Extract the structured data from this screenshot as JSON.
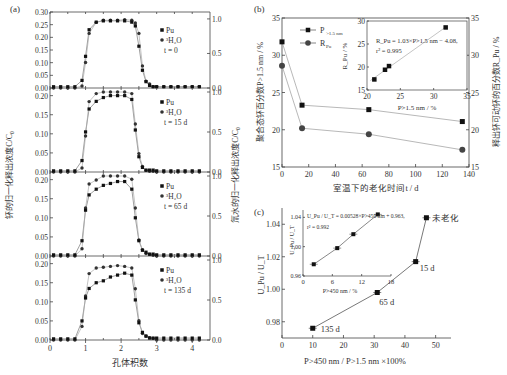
{
  "figure": {
    "panel_a": {
      "label": "(a)",
      "xlabel": "孔体积数",
      "ylabel_left": "钚的归一化释出浓度C/C₀",
      "ylabel_right": "氚水的归一化释出浓度C/C₀",
      "x_ticks": [
        "0",
        "1",
        "2",
        "3",
        "4"
      ],
      "legend": {
        "pu": "Pu",
        "h2o": "³H₂O"
      },
      "subplots": [
        {
          "time_label": "t = 0",
          "y_ticks": [
            "0.00",
            "0.05",
            "0.10",
            "0.15",
            "0.20",
            "0.25",
            "0.30"
          ],
          "y_right_ticks": [
            "0.0",
            "0.5",
            "1.0"
          ]
        },
        {
          "time_label": "t = 15 d",
          "y_ticks": [
            "0.00",
            "0.05",
            "0.10",
            "0.15",
            "0.20"
          ],
          "y_right_ticks": [
            "0.0",
            "0.5",
            "1.0"
          ]
        },
        {
          "time_label": "t = 65 d",
          "y_ticks": [
            "0.00",
            "0.05",
            "0.10",
            "0.15",
            "0.20"
          ],
          "y_right_ticks": [
            "0.0",
            "0.5",
            "1.0"
          ]
        },
        {
          "time_label": "t = 135 d",
          "y_ticks": [
            "0.00",
            "0.05",
            "0.10",
            "0.15",
            "0.20"
          ],
          "y_right_ticks": [
            "0.0",
            "0.5",
            "1.0"
          ]
        }
      ]
    },
    "panel_b": {
      "label": "(b)",
      "xlabel": "室温下的老化时间t / d",
      "ylabel_left": "聚合态钚百分数P>1.5 nm / %",
      "ylabel_right": "释出钚可动钚的百分数R_Pu / %",
      "x_ticks": [
        "0",
        "20",
        "40",
        "60",
        "80",
        "100",
        "120",
        "140"
      ],
      "y_ticks": [
        "15",
        "20",
        "25",
        "30",
        "35"
      ],
      "legend": {
        "p": "P>1.5 nm",
        "r": "R_Pu"
      },
      "inset": {
        "xlabel": "P>1.5 nm / %",
        "ylabel": "R_Pu / %",
        "x_ticks": [
          "20",
          "25",
          "30",
          "35"
        ],
        "y_ticks": [
          "15",
          "20",
          "25",
          "30"
        ],
        "equation": "R_Pu = 1.03×P>1.5 nm − 4.08,",
        "r2": "r² = 0.995"
      }
    },
    "panel_c": {
      "label": "(c)",
      "xlabel": "P>450 nm / P>1.5 nm ×100%",
      "ylabel": "U_Pu / U_T",
      "x_ticks": [
        "0",
        "10",
        "20",
        "30",
        "40",
        "50"
      ],
      "y_ticks": [
        "0.98",
        "1.00",
        "1.02",
        "1.04"
      ],
      "point_labels": [
        "未老化",
        "15 d",
        "65 d",
        "135 d"
      ],
      "inset": {
        "xlabel": "P>450 nm / %",
        "ylabel": "U_Pu / U_T",
        "x_ticks": [
          "0",
          "6",
          "12",
          "18"
        ],
        "y_ticks": [
          "0.96",
          "1.00",
          "1.04"
        ],
        "equation": "U_Pu / U_T = 0.00528×P>450 nm + 0.963,",
        "r2": "r² = 0.992"
      }
    }
  },
  "chart_data": [
    {
      "type": "scatter",
      "title": "(a) Breakthrough curves, t = 0",
      "xlabel": "孔体积数",
      "ylabel": "C/C₀",
      "x": [
        0.1,
        0.3,
        0.5,
        0.7,
        0.9,
        1.0,
        1.1,
        1.3,
        1.5,
        1.7,
        1.9,
        2.1,
        2.3,
        2.4,
        2.5,
        2.6,
        2.7,
        2.8,
        2.9,
        3.0,
        3.2,
        3.4,
        3.6,
        3.8,
        4.0,
        4.2
      ],
      "series": [
        {
          "name": "Pu",
          "values": [
            0.005,
            0.005,
            0.005,
            0.005,
            0.03,
            0.125,
            0.23,
            0.26,
            0.265,
            0.265,
            0.265,
            0.265,
            0.26,
            0.245,
            0.165,
            0.07,
            0.025,
            0.01,
            0.005,
            0.005,
            0.005,
            0.005,
            0.005,
            0.005,
            0.005,
            0.005
          ]
        },
        {
          "name": "³H₂O (right axis)",
          "values": [
            0.0,
            0.0,
            0.0,
            0.0,
            0.03,
            0.37,
            0.79,
            0.95,
            0.98,
            0.98,
            0.98,
            0.99,
            0.98,
            0.94,
            0.79,
            0.32,
            0.1,
            0.06,
            0.02,
            0.02,
            0.02,
            0.02,
            0.02,
            0.02,
            0.02,
            0.02
          ]
        }
      ],
      "ylim": [
        0,
        0.3
      ],
      "y2lim": [
        0,
        1.1
      ]
    },
    {
      "type": "scatter",
      "title": "(a) t = 15 d",
      "x": [
        0.1,
        0.3,
        0.5,
        0.7,
        0.9,
        1.0,
        1.1,
        1.3,
        1.5,
        1.7,
        1.9,
        2.1,
        2.3,
        2.4,
        2.5,
        2.6,
        2.7,
        2.8,
        2.9,
        3.0,
        3.2,
        3.4,
        3.6,
        3.8,
        4.0,
        4.2
      ],
      "series": [
        {
          "name": "Pu",
          "values": [
            0.003,
            0.003,
            0.003,
            0.003,
            0.03,
            0.105,
            0.165,
            0.185,
            0.195,
            0.2,
            0.2,
            0.2,
            0.19,
            0.11,
            0.04,
            0.012,
            0.005,
            0.005,
            0.005,
            0.003,
            0.003,
            0.003,
            0.003,
            0.003,
            0.003,
            0.003
          ]
        },
        {
          "name": "³H₂O (right axis)",
          "values": [
            0,
            0,
            0,
            0,
            0.05,
            0.45,
            0.88,
            0.98,
            1.0,
            1.0,
            1.0,
            1.0,
            0.98,
            0.6,
            0.23,
            0.07,
            0.02,
            0.01,
            0.01,
            0,
            0,
            0,
            0,
            0,
            0,
            0
          ]
        }
      ],
      "ylim": [
        0,
        0.22
      ],
      "y2lim": [
        0,
        1.05
      ]
    },
    {
      "type": "scatter",
      "title": "(a) t = 65 d",
      "x": [
        0.1,
        0.3,
        0.5,
        0.7,
        0.9,
        1.0,
        1.1,
        1.3,
        1.5,
        1.7,
        1.9,
        2.1,
        2.3,
        2.4,
        2.5,
        2.6,
        2.7,
        2.8,
        2.9,
        3.0,
        3.2,
        3.4,
        3.6,
        3.8,
        4.0,
        4.2
      ],
      "series": [
        {
          "name": "Pu",
          "values": [
            0.003,
            0.003,
            0.003,
            0.003,
            0.04,
            0.12,
            0.16,
            0.175,
            0.185,
            0.19,
            0.195,
            0.195,
            0.175,
            0.1,
            0.04,
            0.015,
            0.01,
            0.005,
            0.005,
            0.003,
            0.003,
            0.003,
            0.003,
            0.003,
            0.003,
            0.003
          ]
        },
        {
          "name": "³H₂O (right axis)",
          "values": [
            0,
            0,
            0,
            0,
            0.09,
            0.6,
            0.9,
            0.95,
            1.0,
            1.0,
            1.0,
            1.0,
            0.96,
            0.6,
            0.2,
            0.08,
            0.03,
            0.02,
            0.01,
            0,
            0,
            0,
            0,
            0,
            0,
            0
          ]
        }
      ],
      "ylim": [
        0,
        0.22
      ],
      "y2lim": [
        0,
        1.05
      ]
    },
    {
      "type": "scatter",
      "title": "(a) t = 135 d",
      "x": [
        0.1,
        0.3,
        0.5,
        0.7,
        0.9,
        1.0,
        1.1,
        1.3,
        1.5,
        1.7,
        1.9,
        2.1,
        2.3,
        2.4,
        2.5,
        2.6,
        2.7,
        2.8,
        2.9,
        3.0,
        3.2,
        3.4,
        3.6,
        3.8,
        4.0,
        4.2
      ],
      "series": [
        {
          "name": "Pu",
          "values": [
            0.003,
            0.003,
            0.003,
            0.003,
            0.05,
            0.11,
            0.135,
            0.15,
            0.155,
            0.165,
            0.17,
            0.175,
            0.17,
            0.105,
            0.045,
            0.02,
            0.01,
            0.005,
            0.005,
            0.005,
            0.005,
            0.005,
            0.005,
            0.005,
            0.005,
            0.005
          ]
        },
        {
          "name": "³H₂O (right axis)",
          "values": [
            0,
            0,
            0,
            0,
            0.17,
            0.55,
            0.83,
            0.9,
            0.91,
            0.92,
            0.93,
            0.92,
            0.9,
            0.64,
            0.24,
            0.08,
            0.05,
            0.03,
            0.02,
            0,
            0,
            0,
            0,
            0,
            0,
            0
          ]
        }
      ],
      "ylim": [
        0,
        0.22
      ],
      "y2lim": [
        0,
        1.05
      ]
    },
    {
      "type": "line",
      "title": "(b) Aging effect",
      "xlabel": "室温下的老化时间t / d",
      "ylabel": "P>1.5 nm / %",
      "y2label": "R_Pu / %",
      "x": [
        0,
        15,
        65,
        135
      ],
      "series": [
        {
          "name": "P>1.5 nm",
          "values": [
            31.8,
            23.3,
            22.7,
            21.1
          ]
        },
        {
          "name": "R_Pu",
          "values": [
            28.6,
            20.2,
            19.4,
            17.3
          ]
        }
      ],
      "xlim": [
        0,
        140
      ],
      "ylim": [
        15,
        35
      ]
    },
    {
      "type": "scatter",
      "title": "(b) inset",
      "xlabel": "P>1.5 nm / %",
      "ylabel": "R_Pu / %",
      "x": [
        21.1,
        22.7,
        23.3,
        31.8
      ],
      "values": [
        17.3,
        19.4,
        20.2,
        28.6
      ],
      "annotation": "R_Pu = 1.03×P>1.5 nm − 4.08, r² = 0.995",
      "xlim": [
        20,
        35
      ],
      "ylim": [
        15,
        30
      ]
    },
    {
      "type": "line",
      "title": "(c)",
      "xlabel": "P>450 nm / P>1.5 nm ×100%",
      "ylabel": "U_Pu / U_T",
      "x": [
        47,
        43.5,
        31,
        10
      ],
      "values": [
        1.044,
        1.017,
        0.998,
        0.976
      ],
      "labels": [
        "未老化",
        "15 d",
        "65 d",
        "135 d"
      ],
      "xlim": [
        0,
        55
      ],
      "ylim": [
        0.97,
        1.05
      ]
    },
    {
      "type": "scatter",
      "title": "(c) inset",
      "xlabel": "P>450 nm / %",
      "ylabel": "U_Pu / U_T",
      "x": [
        2.2,
        7,
        10.3,
        15.3
      ],
      "values": [
        0.976,
        0.998,
        1.017,
        1.044
      ],
      "annotation": "U_Pu/U_T = 0.00528×P>450 nm + 0.963, r² = 0.992",
      "xlim": [
        0,
        18
      ],
      "ylim": [
        0.96,
        1.05
      ]
    }
  ]
}
